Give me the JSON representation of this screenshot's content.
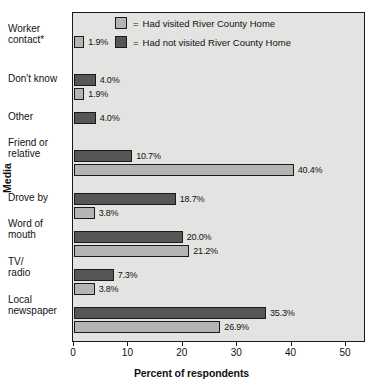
{
  "chart_data": {
    "type": "bar",
    "orientation": "horizontal",
    "title": "",
    "xlabel": "Percent of respondents",
    "ylabel": "Media",
    "xlim": [
      0,
      55
    ],
    "xticks": [
      0,
      10,
      20,
      30,
      40,
      50
    ],
    "xtick_labels": [
      "0",
      "10",
      "20",
      "30",
      "40",
      "50"
    ],
    "grid": false,
    "legend_position": "top-center",
    "categories": [
      "Worker\ncontact*",
      "Don't know",
      "Other",
      "Friend or\nrelative",
      "Drove by",
      "Word of\nmouth",
      "TV/\nradio",
      "Local\nnewspaper"
    ],
    "series": [
      {
        "name": "Had not visited River County Home",
        "color": "#565656",
        "values": [
          null,
          4.0,
          4.0,
          10.7,
          18.7,
          20.0,
          7.3,
          35.3
        ],
        "labels": [
          "",
          "4.0%",
          "4.0%",
          "10.7%",
          "18.7%",
          "20.0%",
          "7.3%",
          "35.3%"
        ]
      },
      {
        "name": "Had visited River County Home",
        "color": "#b4b4b2",
        "values": [
          1.9,
          1.9,
          null,
          40.4,
          3.8,
          21.2,
          3.8,
          26.9
        ],
        "labels": [
          "1.9%",
          "1.9%",
          "",
          "40.4%",
          "3.8%",
          "21.2%",
          "3.8%",
          "26.9%"
        ]
      }
    ]
  },
  "legend": {
    "items": [
      {
        "equals": "=",
        "label": "Had visited River County Home",
        "swatch": "light"
      },
      {
        "equals": "=",
        "label": "Had not visited River County Home",
        "swatch": "dark"
      }
    ]
  },
  "axes": {
    "x_title": "Percent of respondents",
    "y_title": "Media"
  },
  "colors": {
    "plot_background": "#e3e3e1",
    "bar_light": "#b4b4b2",
    "bar_dark": "#565656",
    "outline": "#1a1a1a",
    "text": "#111111"
  }
}
